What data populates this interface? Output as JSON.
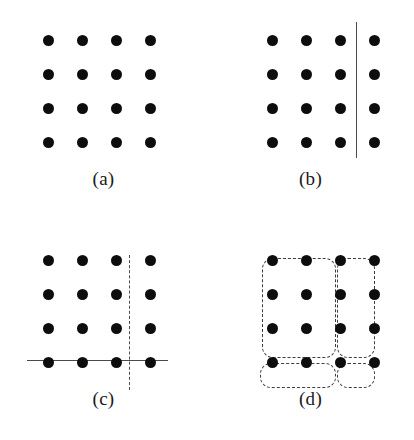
{
  "figure": {
    "caption_style": "parenthesized-letter",
    "background_color": "#ffffff",
    "dot_color": "#0d0d0d",
    "line_color": "#4a4a4a",
    "dash_color": "#3d3d3d"
  },
  "panels": [
    {
      "id": "a",
      "label": "(a)",
      "description": "4x4 grid of dots, no partition",
      "grid": {
        "rows": 4,
        "cols": 4,
        "x0": 48,
        "y0": 40,
        "dx": 34,
        "dy": 34
      },
      "dividers": [],
      "groups": []
    },
    {
      "id": "b",
      "label": "(b)",
      "description": "4x4 grid of dots with one solid vertical divider between column 3 and column 4",
      "grid": {
        "rows": 4,
        "cols": 4,
        "x0": 65,
        "y0": 40,
        "dx": 34,
        "dy": 34
      },
      "dividers": [
        {
          "type": "solid-vertical",
          "x": 149,
          "y1": 22,
          "y2": 158
        }
      ],
      "groups": []
    },
    {
      "id": "c",
      "label": "(c)",
      "description": "4x4 grid of dots with a solid horizontal divider between row 3 and row 4 and a dashed vertical divider between column 3 and column 4",
      "grid": {
        "rows": 4,
        "cols": 4,
        "x0": 48,
        "y0": 40,
        "dx": 34,
        "dy": 34
      },
      "dividers": [
        {
          "type": "solid-horizontal",
          "y": 140,
          "x1": 27,
          "x2": 168
        },
        {
          "type": "dashed-vertical",
          "x": 129,
          "y1": 35,
          "y2": 170
        }
      ],
      "groups": []
    },
    {
      "id": "d",
      "label": "(d)",
      "description": "4x4 grid of dots grouped by four dashed rounded rectangles: a 3x3 block, a 3x1 right column, a 1x3 bottom row and a single corner dot",
      "grid": {
        "rows": 4,
        "cols": 4,
        "x0": 65,
        "y0": 40,
        "dx": 34,
        "dy": 34
      },
      "dividers": [],
      "groups": [
        {
          "name": "block-3x3",
          "x": 55,
          "y": 38,
          "w": 74,
          "h": 100,
          "cells": 9
        },
        {
          "name": "column-3x1",
          "x": 130,
          "y": 38,
          "w": 38,
          "h": 100,
          "cells": 3
        },
        {
          "name": "row-1x3",
          "x": 53,
          "y": 143,
          "w": 76,
          "h": 25,
          "cells": 3
        },
        {
          "name": "single-cell",
          "x": 130,
          "y": 143,
          "w": 38,
          "h": 25,
          "cells": 1
        }
      ]
    }
  ]
}
